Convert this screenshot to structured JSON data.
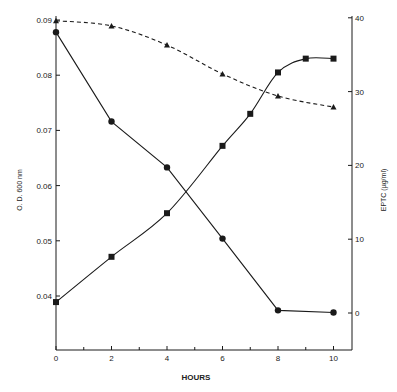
{
  "chart_data": {
    "type": "line",
    "title": "",
    "xlabel": "HOURS",
    "ylabel": "O. D. 600 nm",
    "y2label": "EPTC (µg/ml)",
    "xlim": [
      0,
      10
    ],
    "ylim": [
      0.03,
      0.09
    ],
    "y2lim": [
      -5,
      40
    ],
    "xticks": [
      0,
      2,
      4,
      6,
      8,
      10
    ],
    "xticks_minor": [
      1,
      3,
      5,
      7,
      9
    ],
    "yticks": [
      0.04,
      0.05,
      0.06,
      0.07,
      0.08,
      0.09
    ],
    "yticklabels": [
      "0.04",
      "0.05",
      "0.06",
      "0.07",
      "0.08",
      "0.09"
    ],
    "y2ticks": [
      0,
      10,
      20,
      30,
      40
    ],
    "grid": false,
    "legend": null,
    "series": [
      {
        "name": "O.D. 600 nm (declining, circles)",
        "axis": "left",
        "marker": "circle",
        "linestyle": "solid",
        "x": [
          0,
          2,
          4,
          6,
          8,
          10
        ],
        "values": [
          0.0878,
          0.0716,
          0.0633,
          0.0504,
          0.0374,
          0.037
        ]
      },
      {
        "name": "O.D. 600 nm (growth, squares)",
        "axis": "left",
        "marker": "square",
        "linestyle": "solid",
        "x": [
          0,
          2,
          4,
          6,
          7,
          8,
          9,
          10
        ],
        "values": [
          0.0389,
          0.0471,
          0.055,
          0.0672,
          0.073,
          0.0805,
          0.083,
          0.083
        ]
      },
      {
        "name": "EPTC (µg/ml) (triangles)",
        "axis": "right",
        "marker": "triangle",
        "linestyle": "dashed",
        "x": [
          0,
          2,
          4,
          6,
          8,
          10
        ],
        "values": [
          39.6,
          38.9,
          36.3,
          32.4,
          29.4,
          27.9
        ]
      }
    ]
  },
  "labels": {
    "xlabel": "HOURS",
    "ylabel": "O. D. 600 nm",
    "y2label": "EPTC  (µg/ml)"
  },
  "colors": {
    "ink": "#1a1a1a",
    "background": "#ffffff"
  }
}
